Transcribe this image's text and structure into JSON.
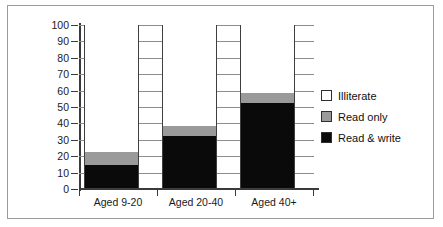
{
  "chart_data": {
    "type": "bar",
    "stacked": true,
    "title": "",
    "xlabel": "",
    "ylabel": "",
    "ylim": [
      0,
      100
    ],
    "yticks": [
      0,
      10,
      20,
      30,
      40,
      50,
      60,
      70,
      80,
      90,
      100
    ],
    "grid": true,
    "legend_position": "right",
    "categories": [
      "Aged 9-20",
      "Aged 20-40",
      "Aged 40+"
    ],
    "series": [
      {
        "name": "Read & write",
        "color": "#0a0a0a",
        "values": [
          14,
          32,
          52
        ]
      },
      {
        "name": "Read only",
        "color": "#9a9a9a",
        "values": [
          8,
          6,
          6
        ]
      },
      {
        "name": "Illiterate",
        "color": "#ffffff",
        "values": [
          78,
          62,
          42
        ]
      }
    ],
    "cumulative_tops": {
      "read_write": [
        14,
        32,
        52
      ],
      "read_only": [
        22,
        38,
        58
      ],
      "illiterate": [
        100,
        100,
        100
      ]
    }
  },
  "axis": {
    "tick_100": "100",
    "tick_90": "90",
    "tick_80": "80",
    "tick_70": "70",
    "tick_60": "60",
    "tick_50": "50",
    "tick_40": "40",
    "tick_30": "30",
    "tick_20": "20",
    "tick_10": "10",
    "tick_0": "0"
  },
  "legend": {
    "items": [
      {
        "label": "Illiterate",
        "color": "#ffffff"
      },
      {
        "label": "Read only",
        "color": "#9a9a9a"
      },
      {
        "label": "Read & write",
        "color": "#0a0a0a"
      }
    ]
  }
}
